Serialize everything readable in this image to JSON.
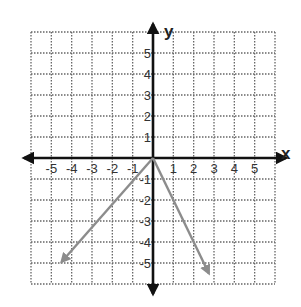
{
  "chart_data": {
    "type": "line",
    "title": "",
    "xlabel": "x",
    "ylabel": "y",
    "xlim": [
      -6,
      6
    ],
    "ylim": [
      -6,
      6
    ],
    "grid": true,
    "grid_style": "dotted",
    "x_ticks": [
      -5,
      -4,
      -3,
      -2,
      -1,
      1,
      2,
      3,
      4,
      5
    ],
    "y_ticks": [
      5,
      4,
      3,
      2,
      1,
      -1,
      -2,
      -3,
      -4,
      -5
    ],
    "x_tick_labels": [
      "-5",
      "-4",
      "-3",
      "-2",
      "-1",
      "1",
      "2",
      "3",
      "4",
      "5"
    ],
    "y_tick_labels": [
      "5",
      "4",
      "3",
      "2",
      "1",
      "-1",
      "-2",
      "-3",
      "-4",
      "-5"
    ],
    "legend": [],
    "series": [
      {
        "name": "left-ray",
        "description": "ray from origin into quadrant III",
        "points": [
          [
            0,
            0
          ],
          [
            -1,
            -1.1
          ],
          [
            -2,
            -2.2
          ],
          [
            -4.5,
            -4.95
          ]
        ],
        "arrow_end": true,
        "color": "#8c8c8c"
      },
      {
        "name": "right-ray",
        "description": "ray from origin into quadrant IV, slope -2",
        "points": [
          [
            0,
            0
          ],
          [
            1,
            -2
          ],
          [
            2,
            -4
          ],
          [
            2.75,
            -5.5
          ]
        ],
        "arrow_end": true,
        "color": "#8c8c8c"
      }
    ]
  },
  "colors": {
    "axis": "#111111",
    "grid": "#666666",
    "rays": "#8c8c8c",
    "background": "#ffffff"
  }
}
